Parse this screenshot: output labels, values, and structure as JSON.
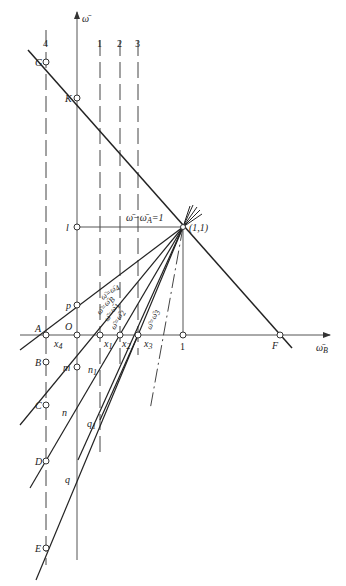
{
  "axes": {
    "y_label": "ω̄",
    "x_label": "ω̄",
    "x_label_sub": "B",
    "tick_one": "1"
  },
  "column_labels": [
    "4",
    "1",
    "2",
    "3"
  ],
  "points": {
    "G": "G",
    "K": "K",
    "l": "l",
    "F": "F",
    "A": "A",
    "O": "O",
    "p": "p",
    "B": "B",
    "C": "C",
    "D": "D",
    "E": "E",
    "m": "m",
    "n": "n",
    "n1": "n",
    "n1_sub": "1",
    "q": "q",
    "q1": "q",
    "q1_sub": "1",
    "pivot": "(1,1)"
  },
  "x_marks": [
    {
      "t": "x",
      "s": "4"
    },
    {
      "t": "x",
      "s": "1"
    },
    {
      "t": "x",
      "s": "2"
    },
    {
      "t": "x",
      "s": "3"
    }
  ],
  "equations": {
    "top": "ω̄−ω̄",
    "top_sub": "A",
    "top_rhs": "=1",
    "l4": "ω̄=ω̄",
    "l4_sub": "4",
    "lB": "ω̄=ω̄",
    "lB_sub": "B",
    "l1": "ω̄=ω̄",
    "l1_sub": "1",
    "l2": "ω̄=ω̄",
    "l2_sub": "2",
    "l3": "ω̄=ω̄",
    "l3_sub": "3"
  }
}
